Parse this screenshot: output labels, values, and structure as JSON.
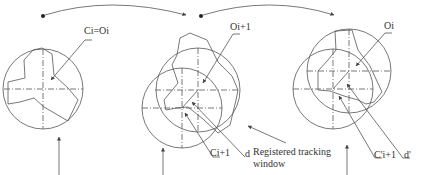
{
  "labels": {
    "frame1_center": "Ci=Oi",
    "frame2_object": "Oi+1",
    "frame2_center": "Ci+1",
    "frame2_dist": "d",
    "window_line1": "Registered tracking",
    "window_line2": "window",
    "frame3_object": "Oi",
    "frame3_center": "C'i+1",
    "frame3_dist": "d'"
  },
  "colors": {
    "line": "#555555",
    "text": "#333333",
    "background": "#ffffff"
  }
}
